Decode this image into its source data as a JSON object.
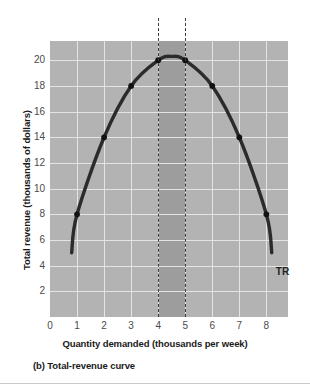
{
  "chart_data": {
    "type": "line",
    "title": "",
    "subtitle": "",
    "caption": "(b) Total-revenue curve",
    "xlabel": "Quantity demanded (thousands per week)",
    "ylabel": "Total revenue (thousands of dollars)",
    "xlim": [
      0,
      8.8
    ],
    "ylim": [
      0,
      21.5
    ],
    "xticks": [
      0,
      1,
      2,
      3,
      4,
      5,
      6,
      7,
      8
    ],
    "xtick_labels": [
      "0",
      "1",
      "2",
      "3",
      "4",
      "5",
      "6",
      "7",
      "8"
    ],
    "yticks": [
      2,
      4,
      6,
      8,
      10,
      12,
      14,
      16,
      18,
      20
    ],
    "ytick_labels": [
      "2",
      "4",
      "6",
      "8",
      "10",
      "12",
      "14",
      "16",
      "18",
      "20"
    ],
    "grid": true,
    "legend_position": "inline-right",
    "series": [
      {
        "name": "TR",
        "label": "TR",
        "x": [
          0.8,
          1,
          2,
          3,
          4,
          4.5,
          5,
          6,
          7,
          8,
          8.2
        ],
        "values": [
          5,
          8,
          14,
          18,
          20,
          20.3,
          20,
          18,
          14,
          8,
          5
        ],
        "markers_x": [
          1,
          2,
          3,
          4,
          5,
          6,
          7,
          8
        ],
        "markers_y": [
          8,
          14,
          18,
          20,
          20,
          18,
          14,
          8
        ],
        "color": "#2b2b2b"
      }
    ],
    "annotations": [
      {
        "name": "elastic-boundary-left",
        "type": "vline",
        "x": 4,
        "style": "dashed",
        "color": "#3a3a3a"
      },
      {
        "name": "elastic-boundary-right",
        "type": "vline",
        "x": 5,
        "style": "dashed",
        "color": "#3a3a3a"
      },
      {
        "name": "unit-elastic-band",
        "type": "vspan",
        "x0": 4,
        "x1": 5,
        "color": "#9d9d9d"
      }
    ],
    "colors": {
      "plot_background": "#b3b3b3",
      "band": "#9d9d9d",
      "grid": "#e4e4e4",
      "curve": "#2b2b2b",
      "text": "#1a1a1a",
      "tick_text": "#4a4a4a",
      "page_background": "#ffffff"
    }
  }
}
